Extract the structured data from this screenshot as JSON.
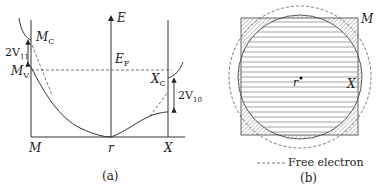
{
  "panel_a": {
    "caption": "(a)",
    "axis_label_energy": "E",
    "fermi_label": "E",
    "fermi_sub": "F",
    "point_labels": {
      "M": "M",
      "r": "r",
      "X": "X"
    },
    "mc_label": "M",
    "mc_sub": "C",
    "mv_label": "M",
    "mv_sub": "V",
    "xc_label": "X",
    "xc_sub": "C",
    "gap_m_label": "2V",
    "gap_m_sub": "11",
    "gap_x_label": "2V",
    "gap_x_sub": "10"
  },
  "panel_b": {
    "caption": "(b)",
    "corner_label": "M",
    "edge_label": "X",
    "center_label": "r",
    "legend": "Free electron"
  },
  "colors": {
    "line": "#333333",
    "hatch": "#777777"
  }
}
